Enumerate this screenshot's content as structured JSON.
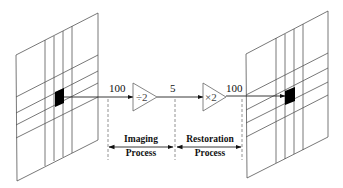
{
  "diagram": {
    "type": "signal-flow",
    "colors": {
      "line": "#555555",
      "pixel": "#000000",
      "background": "#ffffff"
    },
    "left_panel": {
      "name": "original-image-grid",
      "highlighted_pixel": true
    },
    "right_panel": {
      "name": "restored-image-grid",
      "highlighted_pixel": true
    },
    "signal_values": {
      "input": "100",
      "intermediate": "5",
      "output": "100"
    },
    "stages": [
      {
        "symbol": "÷2",
        "operation": "divide by 2"
      },
      {
        "symbol": "×2",
        "operation": "multiply by 2"
      }
    ],
    "process_labels": {
      "imaging": {
        "line1": "Imaging",
        "line2": "Process"
      },
      "restoration": {
        "line1": "Restoration",
        "line2": "Process"
      }
    }
  }
}
